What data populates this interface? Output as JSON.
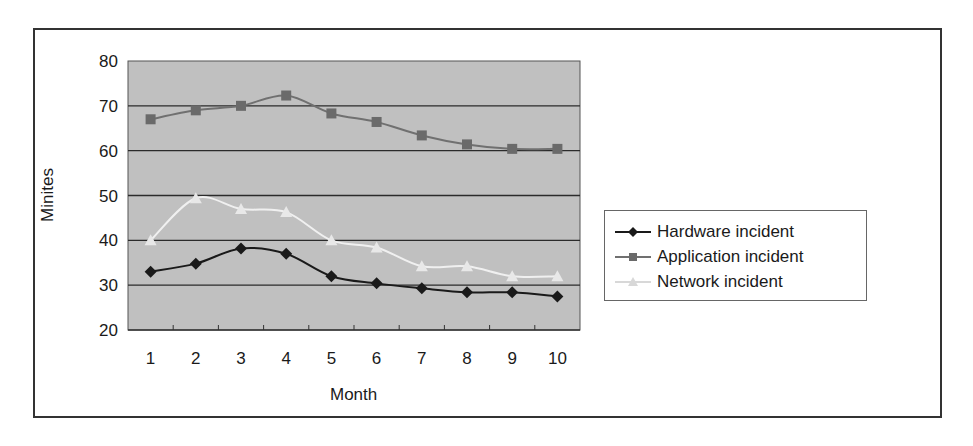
{
  "chart_data": {
    "type": "line",
    "title": "",
    "xlabel": "Month",
    "ylabel": "Minites",
    "x": [
      1,
      2,
      3,
      4,
      5,
      6,
      7,
      8,
      9,
      10
    ],
    "categories": [
      "1",
      "2",
      "3",
      "4",
      "5",
      "6",
      "7",
      "8",
      "9",
      "10"
    ],
    "ylim": [
      20,
      80
    ],
    "yticks": [
      20,
      30,
      40,
      50,
      60,
      70,
      80
    ],
    "grid": true,
    "legend_position": "right",
    "series": [
      {
        "name": "Hardware incident",
        "marker": "diamond",
        "color": "#1a1a1a",
        "values": [
          33,
          34.8,
          38.2,
          37,
          32,
          30.4,
          29.3,
          28.4,
          28.4,
          27.5
        ]
      },
      {
        "name": "Application incident",
        "marker": "square",
        "color": "#707070",
        "values": [
          67,
          69,
          70,
          72.3,
          68.3,
          66.4,
          63.4,
          61.4,
          60.4,
          60.4
        ]
      },
      {
        "name": "Network incident",
        "marker": "triangle",
        "color": "#f2f2f2",
        "values": [
          40,
          49.4,
          47,
          46.3,
          40,
          38.4,
          34.2,
          34.2,
          32,
          32
        ]
      }
    ]
  },
  "axes": {
    "xlabel": "Month",
    "ylabel": "Minites"
  },
  "legend": {
    "items": [
      {
        "label": "Hardware incident"
      },
      {
        "label": "Application incident"
      },
      {
        "label": "Network incident"
      }
    ]
  },
  "colors": {
    "plot_background": "#c0c0c0",
    "gridline": "#2b2b2b"
  }
}
